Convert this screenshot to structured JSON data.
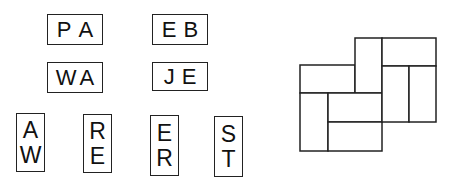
{
  "tiles": [
    {
      "id": "pa",
      "orientation": "horizontal",
      "letters": [
        "P",
        "A"
      ]
    },
    {
      "id": "eb",
      "orientation": "horizontal",
      "letters": [
        "E",
        "B"
      ]
    },
    {
      "id": "wa",
      "orientation": "horizontal",
      "letters": [
        "W",
        "A"
      ]
    },
    {
      "id": "je",
      "orientation": "horizontal",
      "letters": [
        "J",
        "E"
      ]
    },
    {
      "id": "aw",
      "orientation": "vertical",
      "letters": [
        "A",
        "W"
      ]
    },
    {
      "id": "re",
      "orientation": "vertical",
      "letters": [
        "R",
        "E"
      ]
    },
    {
      "id": "er",
      "orientation": "vertical",
      "letters": [
        "E",
        "R"
      ]
    },
    {
      "id": "st",
      "orientation": "vertical",
      "letters": [
        "S",
        "T"
      ]
    }
  ],
  "puzzle_grid": {
    "description": "empty domino layout with 8 rectangular slots",
    "line_color": "#222222"
  }
}
